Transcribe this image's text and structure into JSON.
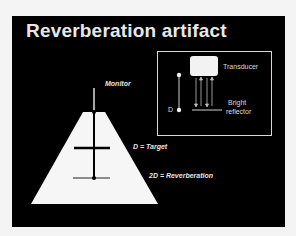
{
  "slide": {
    "title": "Reverberation artifact",
    "background_color": "#000000",
    "page_color": "#f4f4f4"
  },
  "main_diagram": {
    "monitor_label": "Monitor",
    "target_label": "D = Target",
    "reverberation_label": "2D = Reverberation"
  },
  "inset": {
    "transducer_label": "Transducer",
    "depth_label": "D",
    "reflector_label_line1": "Bright",
    "reflector_label_line2": "reflector"
  }
}
